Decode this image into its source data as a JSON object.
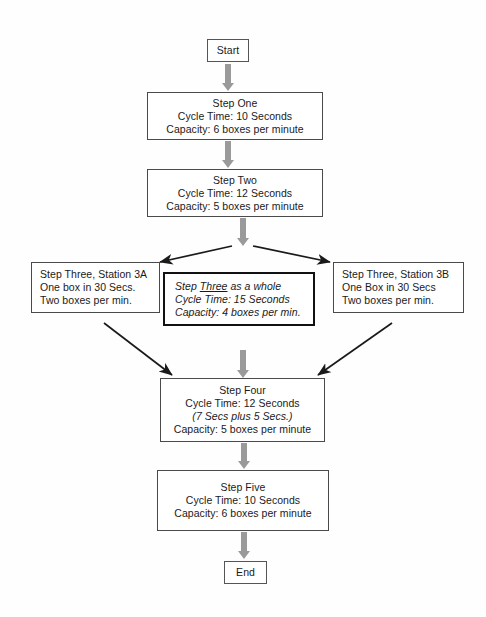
{
  "diagram": {
    "background_color": "#fefefe",
    "arrow_color_vertical": "#9a9a9a",
    "arrow_color_diagonal": "#1a1a1a",
    "box_border_color": "#4a4a4a",
    "emphasis_border_color": "#111111"
  },
  "nodes": {
    "start": {
      "label": "Start"
    },
    "step_one": {
      "line1": "Step One",
      "line2": "Cycle Time: 10 Seconds",
      "line3": "Capacity: 6 boxes per minute"
    },
    "step_two": {
      "line1": "Step Two",
      "line2": "Cycle Time: 12 Seconds",
      "line3": "Capacity: 5 boxes per minute"
    },
    "step_three_a": {
      "line1": "Step Three, Station 3A",
      "line2": "One box in 30 Secs.",
      "line3": "Two boxes per min."
    },
    "step_three_whole": {
      "line1_prefix": "Step ",
      "line1_underlined": "Three",
      "line1_suffix": " as a whole",
      "line2": "Cycle Time: 15 Seconds",
      "line3": "Capacity: 4 boxes per min."
    },
    "step_three_b": {
      "line1": "Step Three, Station 3B",
      "line2": "One Box in 30 Secs",
      "line3": "Two boxes per min."
    },
    "step_four": {
      "line1": "Step Four",
      "line2": "Cycle Time: 12 Seconds",
      "line3": "(7 Secs plus 5 Secs.)",
      "line4": "Capacity: 5 boxes per minute"
    },
    "step_five": {
      "line1": "Step Five",
      "line2": "Cycle Time: 10 Seconds",
      "line3": "Capacity: 6 boxes per minute"
    },
    "end": {
      "label": "End"
    }
  }
}
